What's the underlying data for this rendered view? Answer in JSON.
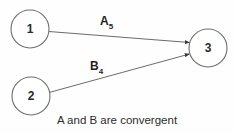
{
  "diagram": {
    "background_color": "#fefefe",
    "node_stroke_color": "#6e6e6e",
    "edge_color": "#5a5a5a",
    "text_color": "#2b2b2b",
    "nodes": [
      {
        "id": "node-1",
        "label": "1",
        "cx": 30,
        "cy": 29,
        "r": 19
      },
      {
        "id": "node-2",
        "label": "2",
        "cx": 31,
        "cy": 96,
        "r": 19
      },
      {
        "id": "node-3",
        "label": "3",
        "cx": 208,
        "cy": 48,
        "r": 19
      }
    ],
    "edges": [
      {
        "id": "edge-a",
        "from": "1",
        "to": "3",
        "label_base": "A",
        "label_sub": "5",
        "label_x": 100,
        "label_y": 25,
        "x1": 48.8,
        "y1": 31.5,
        "x2": 189.5,
        "y2": 42.5
      },
      {
        "id": "edge-b",
        "from": "2",
        "to": "3",
        "label_base": "B",
        "label_sub": "4",
        "label_x": 90,
        "label_y": 70,
        "x1": 49.0,
        "y1": 92.5,
        "x2": 189.5,
        "y2": 54.0
      }
    ],
    "arrowhead": {
      "color": "#3a3a3a"
    },
    "caption": {
      "text": "A and B are convergent",
      "x": 117,
      "y": 124
    }
  }
}
